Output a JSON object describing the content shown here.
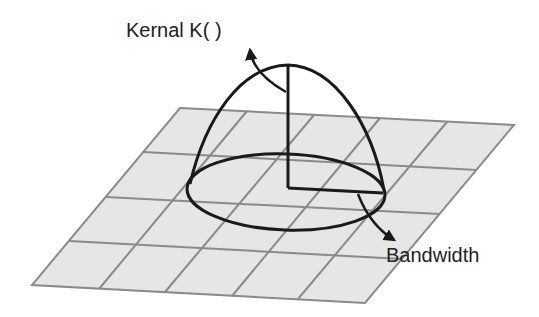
{
  "diagram": {
    "labels": {
      "kernel": "Kernal K( )",
      "bandwidth": "Bandwidth"
    },
    "grid": {
      "rows": 4,
      "cols": 5,
      "fill": "#e6e6e6",
      "line_color": "#8a8a8a"
    },
    "shape_color": "#1a1a1a"
  }
}
